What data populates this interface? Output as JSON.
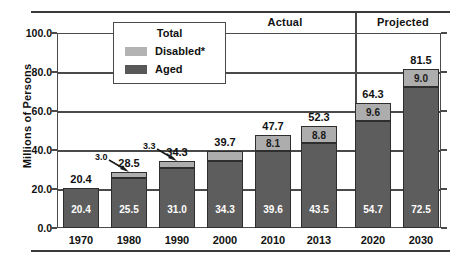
{
  "chart_data": {
    "type": "bar",
    "title": "",
    "subtitle": "",
    "xlabel": "",
    "ylabel": "Millions of Persons",
    "ylim": [
      0.0,
      100.0
    ],
    "yticks": [
      "0.0",
      "20.0",
      "40.0",
      "60.0",
      "80.0",
      "100.0"
    ],
    "ytick_values": [
      0,
      20,
      40,
      60,
      80,
      100
    ],
    "grid": true,
    "stacked": true,
    "legend_position": "top-center-inset",
    "legend_title": "Total",
    "categories": [
      "1970",
      "1980",
      "1990",
      "2000",
      "2010",
      "2013",
      "2020",
      "2030"
    ],
    "series": [
      {
        "name": "Aged",
        "color": "#5d5d5d",
        "values": [
          20.4,
          25.5,
          31.0,
          34.3,
          39.6,
          43.5,
          54.7,
          72.5
        ],
        "labels": [
          "20.4",
          "25.5",
          "31.0",
          "34.3",
          "39.6",
          "43.5",
          "54.7",
          "72.5"
        ]
      },
      {
        "name": "Disabled*",
        "color": "#adadad",
        "values": [
          0.0,
          3.0,
          3.3,
          5.4,
          8.1,
          8.8,
          9.6,
          9.0
        ],
        "labels": [
          "",
          "3.0",
          "3.3",
          "5.4",
          "8.1",
          "8.8",
          "9.6",
          "9.0"
        ]
      }
    ],
    "totals": [
      20.4,
      28.5,
      34.3,
      39.7,
      47.7,
      52.3,
      64.3,
      81.5
    ],
    "total_labels": [
      "20.4",
      "28.5",
      "34.3",
      "39.7",
      "47.7",
      "52.3",
      "64.3",
      "81.5"
    ],
    "callouts": [
      {
        "category": "1980",
        "text": "3.0"
      },
      {
        "category": "1990",
        "text": "3.3"
      }
    ],
    "annotations": {
      "actual": "Actual",
      "projected": "Projected",
      "actual_range": [
        "1970",
        "2013"
      ],
      "projected_range": [
        "2020",
        "2030"
      ]
    }
  },
  "legend": {
    "title": "Total",
    "items": [
      {
        "label": "Disabled*",
        "color": "#adadad"
      },
      {
        "label": "Aged",
        "color": "#5d5d5d"
      }
    ]
  },
  "axis": {
    "y_title": "Millions of Persons",
    "y_labels": [
      "100.0",
      "80.0",
      "60.0",
      "40.0",
      "20.0",
      "0.0"
    ],
    "x_labels": [
      "1970",
      "1980",
      "1990",
      "2000",
      "2010",
      "2013",
      "2020",
      "2030"
    ]
  },
  "headers": {
    "actual": "Actual",
    "projected": "Projected"
  },
  "bar_text": {
    "aged": [
      "20.4",
      "25.5",
      "31.0",
      "34.3",
      "39.6",
      "43.5",
      "54.7",
      "72.5"
    ],
    "disabled": [
      "",
      "3.0",
      "3.3",
      "5.4",
      "8.1",
      "8.8",
      "9.6",
      "9.0"
    ],
    "totals": [
      "20.4",
      "28.5",
      "34.3",
      "39.7",
      "47.7",
      "52.3",
      "64.3",
      "81.5"
    ],
    "callout_1980": "3.0",
    "callout_1990": "3.3"
  }
}
